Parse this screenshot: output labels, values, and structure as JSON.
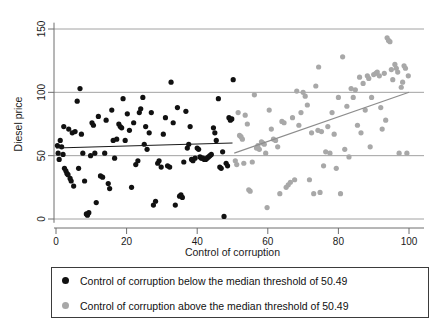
{
  "chart_data": {
    "type": "scatter",
    "title": "",
    "xlabel": "Control of corruption",
    "ylabel": "Diesel price",
    "xlim": [
      -2,
      103
    ],
    "ylim": [
      -5,
      158
    ],
    "xticks": [
      0,
      20,
      40,
      60,
      80,
      100
    ],
    "yticks": [
      0,
      50,
      100,
      150
    ],
    "grid": "horizontal",
    "legend_position": "below-plot",
    "threshold": 50.49,
    "series": [
      {
        "name": "Control of corruption below the median threshold of 50.49",
        "color": "#111111",
        "marker": "circle",
        "points": [
          [
            0.4,
            58
          ],
          [
            0.6,
            52
          ],
          [
            0.9,
            47
          ],
          [
            1.2,
            62
          ],
          [
            1.6,
            57
          ],
          [
            2.0,
            51
          ],
          [
            2.2,
            73
          ],
          [
            2.4,
            40
          ],
          [
            2.8,
            38
          ],
          [
            3.1,
            36
          ],
          [
            3.4,
            35
          ],
          [
            3.6,
            71
          ],
          [
            4.0,
            32
          ],
          [
            4.3,
            30
          ],
          [
            4.6,
            68
          ],
          [
            5.0,
            26
          ],
          [
            5.4,
            69
          ],
          [
            6.0,
            93
          ],
          [
            6.4,
            40
          ],
          [
            6.8,
            103
          ],
          [
            7.2,
            67
          ],
          [
            7.6,
            52
          ],
          [
            8.1,
            30
          ],
          [
            8.6,
            4
          ],
          [
            8.9,
            3
          ],
          [
            9.3,
            5
          ],
          [
            9.8,
            50
          ],
          [
            10.2,
            76
          ],
          [
            10.6,
            74
          ],
          [
            11.0,
            52
          ],
          [
            11.4,
            13
          ],
          [
            12.0,
            81
          ],
          [
            12.6,
            34
          ],
          [
            13.2,
            33
          ],
          [
            13.8,
            52
          ],
          [
            14.2,
            78
          ],
          [
            14.8,
            28
          ],
          [
            15.2,
            24
          ],
          [
            15.8,
            86
          ],
          [
            16.2,
            62
          ],
          [
            16.6,
            48
          ],
          [
            17.2,
            63
          ],
          [
            17.8,
            75
          ],
          [
            18.2,
            73
          ],
          [
            18.6,
            72
          ],
          [
            19.0,
            95
          ],
          [
            19.6,
            62
          ],
          [
            20.2,
            83
          ],
          [
            20.8,
            70
          ],
          [
            21.4,
            25
          ],
          [
            22.0,
            76
          ],
          [
            22.6,
            43
          ],
          [
            23.2,
            46
          ],
          [
            23.6,
            84
          ],
          [
            24.0,
            87
          ],
          [
            24.6,
            96
          ],
          [
            25.0,
            59
          ],
          [
            25.4,
            73
          ],
          [
            25.8,
            55
          ],
          [
            26.4,
            68
          ],
          [
            27.0,
            84
          ],
          [
            27.6,
            11
          ],
          [
            28.2,
            14
          ],
          [
            28.8,
            44
          ],
          [
            29.2,
            46
          ],
          [
            29.8,
            41
          ],
          [
            30.4,
            67
          ],
          [
            31.0,
            80
          ],
          [
            31.6,
            42
          ],
          [
            32.2,
            41
          ],
          [
            32.6,
            108
          ],
          [
            33.2,
            76
          ],
          [
            33.8,
            11
          ],
          [
            34.4,
            88
          ],
          [
            35.0,
            18
          ],
          [
            35.4,
            19
          ],
          [
            35.8,
            17
          ],
          [
            36.2,
            45
          ],
          [
            36.8,
            85
          ],
          [
            37.2,
            56
          ],
          [
            37.6,
            59
          ],
          [
            38.0,
            73
          ],
          [
            38.4,
            47
          ],
          [
            38.8,
            46
          ],
          [
            39.4,
            48
          ],
          [
            40.0,
            56
          ],
          [
            40.4,
            55
          ],
          [
            40.8,
            49
          ],
          [
            41.2,
            48
          ],
          [
            41.6,
            48
          ],
          [
            42.0,
            47
          ],
          [
            42.4,
            47
          ],
          [
            42.8,
            48
          ],
          [
            43.2,
            49
          ],
          [
            43.6,
            50
          ],
          [
            44.0,
            51
          ],
          [
            44.6,
            72
          ],
          [
            45.0,
            68
          ],
          [
            45.4,
            62
          ],
          [
            46.0,
            95
          ],
          [
            46.4,
            41
          ],
          [
            46.8,
            40
          ],
          [
            47.2,
            53
          ],
          [
            47.6,
            2
          ],
          [
            48.2,
            44
          ],
          [
            48.6,
            42
          ],
          [
            49.0,
            80
          ],
          [
            49.4,
            78
          ],
          [
            49.8,
            79
          ],
          [
            50.2,
            110
          ]
        ]
      },
      {
        "name": "Control of corruption above the median threshold of 50.49",
        "color": "#a8a8a8",
        "marker": "circle",
        "points": [
          [
            50.8,
            46
          ],
          [
            51.2,
            43
          ],
          [
            51.6,
            84
          ],
          [
            52.0,
            66
          ],
          [
            52.4,
            65
          ],
          [
            52.8,
            63
          ],
          [
            53.2,
            44
          ],
          [
            53.6,
            82
          ],
          [
            54.2,
            75
          ],
          [
            54.6,
            23
          ],
          [
            55.0,
            22
          ],
          [
            55.6,
            45
          ],
          [
            56.2,
            98
          ],
          [
            56.8,
            56
          ],
          [
            57.2,
            58
          ],
          [
            57.6,
            55
          ],
          [
            58.2,
            61
          ],
          [
            58.6,
            60
          ],
          [
            59.0,
            59
          ],
          [
            59.4,
            52
          ],
          [
            59.8,
            9
          ],
          [
            60.4,
            86
          ],
          [
            61.0,
            71
          ],
          [
            61.6,
            63
          ],
          [
            62.2,
            62
          ],
          [
            62.8,
            57
          ],
          [
            63.4,
            20
          ],
          [
            64.0,
            77
          ],
          [
            64.6,
            76
          ],
          [
            65.2,
            25
          ],
          [
            65.8,
            27
          ],
          [
            66.4,
            29
          ],
          [
            67.0,
            80
          ],
          [
            67.6,
            31
          ],
          [
            68.2,
            101
          ],
          [
            68.8,
            74
          ],
          [
            69.4,
            84
          ],
          [
            70.0,
            100
          ],
          [
            70.6,
            97
          ],
          [
            71.2,
            90
          ],
          [
            71.8,
            31
          ],
          [
            72.4,
            68
          ],
          [
            73.0,
            20
          ],
          [
            73.6,
            105
          ],
          [
            74.2,
            70
          ],
          [
            74.4,
            120
          ],
          [
            74.8,
            21
          ],
          [
            75.2,
            69
          ],
          [
            75.8,
            42
          ],
          [
            76.4,
            53
          ],
          [
            77.0,
            73
          ],
          [
            77.6,
            52
          ],
          [
            78.2,
            84
          ],
          [
            78.8,
            67
          ],
          [
            79.4,
            40
          ],
          [
            80.0,
            96
          ],
          [
            80.6,
            20
          ],
          [
            81.2,
            128
          ],
          [
            81.8,
            55
          ],
          [
            82.4,
            89
          ],
          [
            83.0,
            49
          ],
          [
            83.6,
            103
          ],
          [
            84.2,
            96
          ],
          [
            84.8,
            102
          ],
          [
            85.4,
            74
          ],
          [
            86.0,
            112
          ],
          [
            86.4,
            68
          ],
          [
            87.0,
            107
          ],
          [
            87.6,
            86
          ],
          [
            88.2,
            113
          ],
          [
            88.6,
            111
          ],
          [
            89.0,
            57
          ],
          [
            89.4,
            96
          ],
          [
            90.0,
            114
          ],
          [
            90.6,
            115
          ],
          [
            91.0,
            116
          ],
          [
            91.6,
            113
          ],
          [
            92.0,
            88
          ],
          [
            92.4,
            71
          ],
          [
            93.0,
            115
          ],
          [
            93.4,
            78
          ],
          [
            93.8,
            143
          ],
          [
            94.2,
            141
          ],
          [
            94.6,
            140
          ],
          [
            95.0,
            118
          ],
          [
            95.4,
            110
          ],
          [
            96.0,
            122
          ],
          [
            96.4,
            119
          ],
          [
            96.8,
            116
          ],
          [
            97.2,
            52
          ],
          [
            97.8,
            104
          ],
          [
            98.2,
            108
          ],
          [
            98.6,
            121
          ],
          [
            99.0,
            119
          ],
          [
            99.4,
            52
          ],
          [
            99.8,
            113
          ]
        ]
      }
    ],
    "fit_lines": [
      {
        "name": "fit-below-threshold",
        "color": "#1a1a1a",
        "x0": 0,
        "y0": 56,
        "x1": 50,
        "y1": 60
      },
      {
        "name": "fit-above-threshold",
        "color": "#8d8d8d",
        "x0": 50.49,
        "y0": 52,
        "x1": 100,
        "y1": 100
      }
    ]
  },
  "legend": {
    "items": [
      {
        "marker_color": "#111111",
        "label": "Control of corruption below the median threshold of 50.49"
      },
      {
        "marker_color": "#a8a8a8",
        "label": "Control of corruption above the median threshold of 50.49"
      }
    ]
  },
  "axes": {
    "x_title": "Control of corruption",
    "y_title": "Diesel price",
    "x_tick_labels": [
      "0",
      "20",
      "40",
      "60",
      "80",
      "100"
    ],
    "y_tick_labels": [
      "0",
      "50",
      "100",
      "150"
    ]
  }
}
